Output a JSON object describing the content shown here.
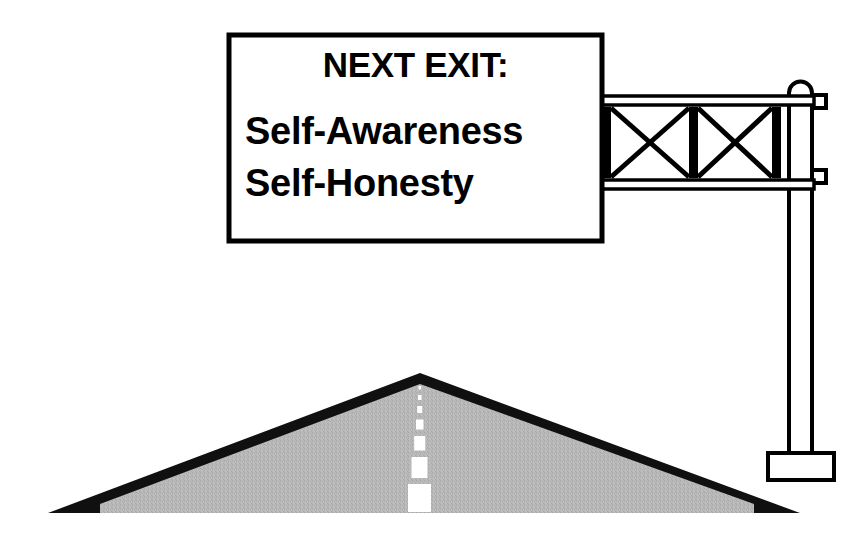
{
  "illustration": {
    "title": "Highway overhead sign over a hill road",
    "background_color": "#ffffff"
  },
  "sign": {
    "name": "overhead-guide-sign",
    "border_color": "#000000",
    "face_color": "#ffffff",
    "text_color": "#000000",
    "headline": "NEXT EXIT:",
    "lines": [
      "Self-Awareness",
      "Self-Honesty"
    ]
  },
  "gantry": {
    "name": "sign-gantry",
    "structure_color": "#000000",
    "truss": {
      "bays": 2,
      "brace_style": "X"
    },
    "pole": {
      "bracket_count": 2,
      "base_style": "rectangular-footing"
    }
  },
  "road": {
    "name": "hill-road",
    "surface_color": "#b5b5b5",
    "edge_color": "#000000",
    "center_line_color": "#ffffff",
    "center_line_dashes": 7
  }
}
